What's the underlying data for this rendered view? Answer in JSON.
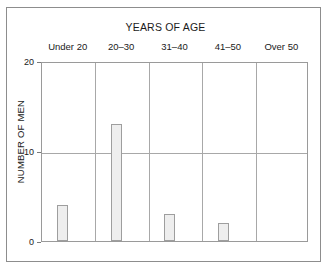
{
  "chart_data": {
    "type": "bar",
    "title": "YEARS OF AGE",
    "xlabel": "",
    "ylabel": "NUMBER OF MEN",
    "categories": [
      "Under 20",
      "20–30",
      "31–40",
      "41–50",
      "Over 50"
    ],
    "values": [
      4,
      13,
      3,
      2,
      0
    ],
    "ylim": [
      0,
      20
    ],
    "ytick_labels": [
      "0",
      "10",
      "20"
    ],
    "ytick_values": [
      0,
      10,
      20
    ],
    "grid": "horizontal gridline at 10; vertical dividers between categories",
    "legend": "none",
    "bar_fill_color": "#eeeeee",
    "bar_edge_color": "#9e9e9e",
    "axis_color": "#9a9a9a",
    "frame_color": "#8d8d8d",
    "text_color": "#1a1a1a"
  }
}
